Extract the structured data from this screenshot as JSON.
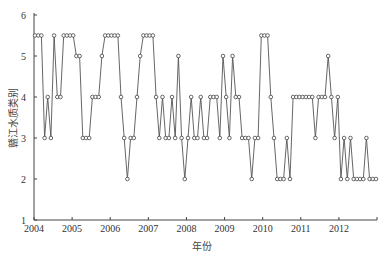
{
  "chart_data": {
    "type": "line",
    "title": "",
    "xlabel": "年份",
    "ylabel": "赣江水质类别",
    "ylim": [
      1,
      6
    ],
    "yticks": [
      "1",
      "2",
      "3",
      "4",
      "5",
      "6"
    ],
    "xticks": [
      "2004",
      "2005",
      "2006",
      "2007",
      "2008",
      "2009",
      "2010",
      "2011",
      "2012"
    ],
    "xlim": [
      2004,
      2013
    ],
    "grid": false,
    "legend": null,
    "marker": "open-circle",
    "series": [
      {
        "name": "赣江水质类别",
        "frequency": "monthly",
        "start": "2004-01",
        "values": [
          5.5,
          5.5,
          5.5,
          3,
          4,
          3,
          5.5,
          4,
          4,
          5.5,
          5.5,
          5.5,
          5.5,
          5,
          5,
          3,
          3,
          3,
          4,
          4,
          4,
          5,
          5.5,
          5.5,
          5.5,
          5.5,
          5.5,
          4,
          3,
          2,
          3,
          3,
          4,
          5,
          5.5,
          5.5,
          5.5,
          5.5,
          4,
          3,
          4,
          3,
          3,
          4,
          3,
          5,
          3,
          2,
          3,
          4,
          3,
          3,
          4,
          3,
          3,
          4,
          4,
          4,
          3,
          5,
          4,
          3,
          5,
          4,
          4,
          3,
          3,
          3,
          2,
          3,
          3,
          5.5,
          5.5,
          5.5,
          4,
          3,
          2,
          2,
          2,
          3,
          2,
          4,
          4,
          4,
          4,
          4,
          4,
          4,
          3,
          4,
          4,
          4,
          5,
          4,
          3,
          4,
          2,
          3,
          2,
          3,
          2,
          2,
          2,
          2,
          3,
          2,
          2,
          2
        ]
      }
    ]
  },
  "colors": {
    "line": "#555555",
    "marker_fill": "#ffffff",
    "axis": "#444444"
  }
}
